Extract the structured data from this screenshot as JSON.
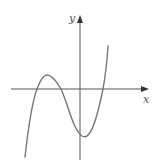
{
  "figure": {
    "x_label": "x",
    "y_label": "y",
    "axis_color": "#555555",
    "curve_color": "#777777",
    "curve_points": "M25,157 C28,130 31,105 37,89 C41,78 44,75 47,75 C52,75 57,82 61,89 C68,104 73,130 82,136 C89,140 95,128 103,89 C105,78 107,62 108,46"
  },
  "chart_data": {
    "type": "line",
    "title": "",
    "xlabel": "x",
    "ylabel": "y",
    "features": {
      "roots": [
        "negative",
        "negative",
        "positive"
      ],
      "local_max": {
        "x_sign": "negative",
        "y_sign": "positive"
      },
      "local_min": {
        "x_sign": "positive",
        "y_sign": "negative"
      },
      "y_intercept_sign": "negative"
    },
    "grid": false
  }
}
